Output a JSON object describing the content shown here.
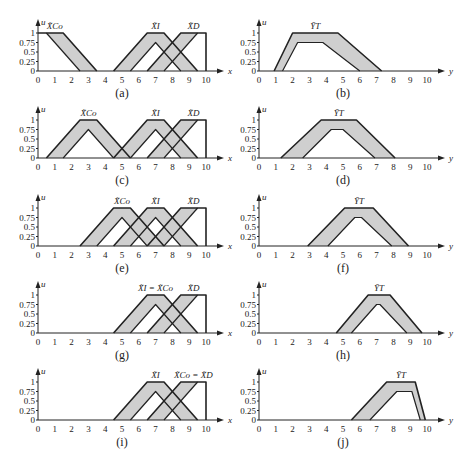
{
  "figure": {
    "x_axis_label": "x",
    "y_axis_label_left": "u",
    "y_axis_label_right": "u",
    "right_axis_label": "y",
    "x_ticks": [
      "0",
      "1",
      "2",
      "3",
      "4",
      "5",
      "6",
      "7",
      "8",
      "9",
      "10"
    ],
    "y_ticks": [
      "0",
      "0.25",
      "0.5",
      "0.75",
      "1"
    ],
    "colors": {
      "fou_fill": "#cfcfcf",
      "line": "#222222",
      "background": "#ffffff"
    }
  },
  "chart_data": [
    {
      "panel": "(a)",
      "type": "area",
      "xlabel": "x",
      "ylabel": "u",
      "xlim": [
        0,
        10
      ],
      "ylim": [
        0,
        1
      ],
      "series": [
        {
          "name": "X_Co",
          "umf": [
            [
              0,
              1
            ],
            [
              1.5,
              1
            ],
            [
              3.5,
              0
            ]
          ],
          "lmf": [
            [
              0.5,
              1
            ],
            [
              2.5,
              0
            ]
          ],
          "lmf_peak": 1
        },
        {
          "name": "X_I",
          "umf": [
            [
              4.5,
              0
            ],
            [
              6.5,
              1
            ],
            [
              7.5,
              1
            ],
            [
              9.5,
              0
            ]
          ],
          "lmf": [
            [
              5.5,
              0
            ],
            [
              7,
              0.75
            ],
            [
              8.5,
              0
            ]
          ]
        },
        {
          "name": "X_D",
          "umf": [
            [
              6.5,
              0
            ],
            [
              8.5,
              1
            ],
            [
              10,
              1
            ],
            [
              10,
              0
            ]
          ],
          "lmf": [
            [
              7.5,
              0
            ],
            [
              9.5,
              1
            ]
          ]
        }
      ]
    },
    {
      "panel": "(b)",
      "type": "area",
      "xlabel": "y",
      "ylabel": "u",
      "xlim": [
        0,
        10
      ],
      "ylim": [
        0,
        1
      ],
      "series": [
        {
          "name": "Y_T",
          "umf": [
            [
              0.9,
              0
            ],
            [
              2,
              1
            ],
            [
              4.7,
              1
            ],
            [
              7.3,
              0
            ]
          ],
          "lmf": [
            [
              1.4,
              0
            ],
            [
              2.3,
              0.75
            ],
            [
              3.8,
              0.75
            ],
            [
              6,
              0
            ]
          ]
        }
      ]
    },
    {
      "panel": "(c)",
      "type": "area",
      "xlabel": "x",
      "ylabel": "u",
      "xlim": [
        0,
        10
      ],
      "ylim": [
        0,
        1
      ],
      "series": [
        {
          "name": "X_Co",
          "umf": [
            [
              0.5,
              0
            ],
            [
              2.5,
              1
            ],
            [
              3.5,
              1
            ],
            [
              5.5,
              0
            ]
          ],
          "lmf": [
            [
              1.5,
              0
            ],
            [
              3,
              0.75
            ],
            [
              4.5,
              0
            ]
          ]
        },
        {
          "name": "X_I",
          "umf": [
            [
              4.5,
              0
            ],
            [
              6.5,
              1
            ],
            [
              7.5,
              1
            ],
            [
              9.5,
              0
            ]
          ],
          "lmf": [
            [
              5.5,
              0
            ],
            [
              7,
              0.75
            ],
            [
              8.5,
              0
            ]
          ]
        },
        {
          "name": "X_D",
          "umf": [
            [
              6.5,
              0
            ],
            [
              8.5,
              1
            ],
            [
              10,
              1
            ],
            [
              10,
              0
            ]
          ],
          "lmf": [
            [
              7.5,
              0
            ],
            [
              9.5,
              1
            ]
          ]
        }
      ]
    },
    {
      "panel": "(d)",
      "type": "area",
      "xlabel": "y",
      "ylabel": "u",
      "xlim": [
        0,
        10
      ],
      "ylim": [
        0,
        1
      ],
      "series": [
        {
          "name": "Y_T",
          "umf": [
            [
              1.3,
              0
            ],
            [
              3.7,
              1
            ],
            [
              5.8,
              1
            ],
            [
              8.1,
              0
            ]
          ],
          "lmf": [
            [
              2.6,
              0
            ],
            [
              4.3,
              0.75
            ],
            [
              5,
              0.75
            ],
            [
              6.9,
              0
            ]
          ]
        }
      ]
    },
    {
      "panel": "(e)",
      "type": "area",
      "xlabel": "x",
      "ylabel": "u",
      "xlim": [
        0,
        10
      ],
      "ylim": [
        0,
        1
      ],
      "series": [
        {
          "name": "X_Co",
          "umf": [
            [
              2.5,
              0
            ],
            [
              4.5,
              1
            ],
            [
              5.5,
              1
            ],
            [
              7.5,
              0
            ]
          ],
          "lmf": [
            [
              3.5,
              0
            ],
            [
              5,
              0.75
            ],
            [
              6.5,
              0
            ]
          ]
        },
        {
          "name": "X_I",
          "umf": [
            [
              4.5,
              0
            ],
            [
              6.5,
              1
            ],
            [
              7.5,
              1
            ],
            [
              9.5,
              0
            ]
          ],
          "lmf": [
            [
              5.5,
              0
            ],
            [
              7,
              0.75
            ],
            [
              8.5,
              0
            ]
          ]
        },
        {
          "name": "X_D",
          "umf": [
            [
              6.5,
              0
            ],
            [
              8.5,
              1
            ],
            [
              10,
              1
            ],
            [
              10,
              0
            ]
          ],
          "lmf": [
            [
              7.5,
              0
            ],
            [
              9.5,
              1
            ]
          ]
        }
      ]
    },
    {
      "panel": "(f)",
      "type": "area",
      "xlabel": "y",
      "ylabel": "u",
      "xlim": [
        0,
        10
      ],
      "ylim": [
        0,
        1
      ],
      "series": [
        {
          "name": "Y_T",
          "umf": [
            [
              2.9,
              0
            ],
            [
              5.1,
              1
            ],
            [
              6.8,
              1
            ],
            [
              8.9,
              0
            ]
          ],
          "lmf": [
            [
              4.1,
              0
            ],
            [
              5.7,
              0.75
            ],
            [
              6.1,
              0.75
            ],
            [
              7.9,
              0
            ]
          ]
        }
      ]
    },
    {
      "panel": "(g)",
      "type": "area",
      "xlabel": "x",
      "ylabel": "u",
      "xlim": [
        0,
        10
      ],
      "ylim": [
        0,
        1
      ],
      "series": [
        {
          "name": "X_I = X_Co",
          "umf": [
            [
              4.5,
              0
            ],
            [
              6.5,
              1
            ],
            [
              7.5,
              1
            ],
            [
              9.5,
              0
            ]
          ],
          "lmf": [
            [
              5.5,
              0
            ],
            [
              7,
              0.75
            ],
            [
              8.5,
              0
            ]
          ]
        },
        {
          "name": "X_D",
          "umf": [
            [
              6.5,
              0
            ],
            [
              8.5,
              1
            ],
            [
              10,
              1
            ],
            [
              10,
              0
            ]
          ],
          "lmf": [
            [
              7.5,
              0
            ],
            [
              9.5,
              1
            ]
          ]
        }
      ]
    },
    {
      "panel": "(h)",
      "type": "area",
      "xlabel": "y",
      "ylabel": "u",
      "xlim": [
        0,
        10
      ],
      "ylim": [
        0,
        1
      ],
      "series": [
        {
          "name": "Y_T",
          "umf": [
            [
              4.6,
              0
            ],
            [
              6.5,
              1
            ],
            [
              7.8,
              1
            ],
            [
              9.7,
              0
            ]
          ],
          "lmf": [
            [
              5.5,
              0
            ],
            [
              7,
              0.75
            ],
            [
              7.2,
              0.75
            ],
            [
              8.8,
              0
            ]
          ]
        }
      ]
    },
    {
      "panel": "(i)",
      "type": "area",
      "xlabel": "x",
      "ylabel": "u",
      "xlim": [
        0,
        10
      ],
      "ylim": [
        0,
        1
      ],
      "series": [
        {
          "name": "X_I",
          "umf": [
            [
              4.5,
              0
            ],
            [
              6.5,
              1
            ],
            [
              7.5,
              1
            ],
            [
              9.5,
              0
            ]
          ],
          "lmf": [
            [
              5.5,
              0
            ],
            [
              7,
              0.75
            ],
            [
              8.5,
              0
            ]
          ]
        },
        {
          "name": "X_Co = X_D",
          "umf": [
            [
              6.5,
              0
            ],
            [
              8.5,
              1
            ],
            [
              10,
              1
            ],
            [
              10,
              0
            ]
          ],
          "lmf": [
            [
              7.5,
              0
            ],
            [
              9.5,
              1
            ]
          ]
        }
      ]
    },
    {
      "panel": "(j)",
      "type": "area",
      "xlabel": "y",
      "ylabel": "u",
      "xlim": [
        0,
        10
      ],
      "ylim": [
        0,
        1
      ],
      "series": [
        {
          "name": "Y_T",
          "umf": [
            [
              5.5,
              0
            ],
            [
              7.6,
              1
            ],
            [
              9.3,
              1
            ],
            [
              9.9,
              0
            ]
          ],
          "lmf": [
            [
              6.6,
              0
            ],
            [
              8.2,
              0.75
            ],
            [
              9.1,
              0.75
            ],
            [
              9.6,
              0
            ]
          ]
        }
      ]
    }
  ],
  "panels": {
    "a": {
      "label": "(a)",
      "names": [
        "X̃Co",
        "X̃I",
        "X̃D"
      ]
    },
    "b": {
      "label": "(b)",
      "names": [
        "ỸT"
      ]
    },
    "c": {
      "label": "(c)",
      "names": [
        "X̃Co",
        "X̃I",
        "X̃D"
      ]
    },
    "d": {
      "label": "(d)",
      "names": [
        "ỸT"
      ]
    },
    "e": {
      "label": "(e)",
      "names": [
        "X̃Co",
        "X̃I",
        "X̃D"
      ]
    },
    "f": {
      "label": "(f)",
      "names": [
        "ỸT"
      ]
    },
    "g": {
      "label": "(g)",
      "names": [
        "X̃I = X̃Co",
        "X̃D"
      ]
    },
    "h": {
      "label": "(h)",
      "names": [
        "ỸT"
      ]
    },
    "i": {
      "label": "(i)",
      "names": [
        "X̃I",
        "X̃Co = X̃D"
      ]
    },
    "j": {
      "label": "(j)",
      "names": [
        "ỸT"
      ]
    }
  },
  "caption": "... Co, I, D, and ... Feedback and Output ..."
}
